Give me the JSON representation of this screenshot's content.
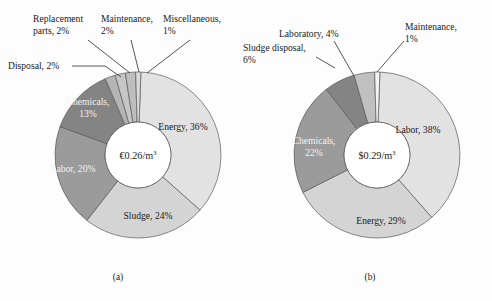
{
  "figure": {
    "background_color": "#fdfdfd",
    "subfigures": [
      {
        "caption": "(a)",
        "caption_x": 118,
        "caption_y": 280,
        "center_x": 138,
        "center_y": 155,
        "outer_radius": 83,
        "inner_radius": 33,
        "center_label_main": "€0.26/m",
        "center_label_sup": "3",
        "center_label_full": "€0.26/m³"
      },
      {
        "caption": "(b)",
        "caption_x": 370,
        "caption_y": 280,
        "center_x": 377,
        "center_y": 155,
        "outer_radius": 83,
        "inner_radius": 33,
        "center_label_main": "$0.29/m",
        "center_label_sup": "3",
        "center_label_full": "$0.29/m³"
      }
    ]
  },
  "chart_data": [
    {
      "type": "pie",
      "title": "(a)",
      "subtitle": "Operating cost breakdown, €0.26/m³",
      "center_value": "€0.26/m³",
      "unit": "percent",
      "start_angle_deg": -88,
      "direction": "clockwise",
      "grid": false,
      "legend": "none",
      "labels_placement": "inside-and-leader-lines",
      "categories": [
        "Energy",
        "Sludge",
        "Labor",
        "Chemicals",
        "Disposal",
        "Replacement parts",
        "Maintenance",
        "Miscellaneous"
      ],
      "values": [
        36,
        24,
        20,
        13,
        2,
        2,
        2,
        1
      ],
      "slices": [
        {
          "label": "Energy, 36%",
          "name": "Energy",
          "value": 36,
          "color": "#e2e2e2",
          "label_kind": "inside-dark",
          "label_x": 183,
          "label_y": 130
        },
        {
          "label": "Sludge, 24%",
          "name": "Sludge",
          "value": 24,
          "color": "#d4d4d4",
          "label_kind": "inside-dark",
          "label_x": 148,
          "label_y": 219
        },
        {
          "label": "Labor, 20%",
          "name": "Labor",
          "value": 20,
          "color": "#9b9b9b",
          "label_kind": "inside-light",
          "label_x": 73,
          "label_y": 172
        },
        {
          "label": "Chemicals,",
          "label2": "13%",
          "name": "Chemicals",
          "value": 13,
          "color": "#848484",
          "label_kind": "inside-light",
          "label_x": 88,
          "label_y": 105
        },
        {
          "label": "Disposal, 2%",
          "name": "Disposal",
          "value": 2,
          "color": "#b5b5b5",
          "label_kind": "leader",
          "label_x": 8,
          "label_y": 69,
          "leader": [
            [
              72,
              66
            ],
            [
              105,
              66
            ],
            [
              121,
              77
            ]
          ]
        },
        {
          "label": "Replacement",
          "label2": "parts, 2%",
          "name": "Replacement parts",
          "value": 2,
          "color": "#c6c6c6",
          "label_kind": "leader",
          "label_x": 33,
          "label_y": 22,
          "leader": [
            [
              88,
              40
            ],
            [
              130,
              73
            ]
          ]
        },
        {
          "label": "Maintenance,",
          "label2": "2%",
          "name": "Maintenance",
          "value": 2,
          "color": "#bdbdbd",
          "label_kind": "leader",
          "label_x": 101,
          "label_y": 22,
          "leader": [
            [
              131,
              40
            ],
            [
              139,
              72
            ]
          ]
        },
        {
          "label": "Miscellaneous,",
          "label2": "1%",
          "name": "Miscellaneous",
          "value": 1,
          "color": "#dadada",
          "label_kind": "leader",
          "label_x": 163,
          "label_y": 22,
          "leader": [
            [
              190,
              40
            ],
            [
              147,
              73
            ]
          ]
        }
      ]
    },
    {
      "type": "pie",
      "title": "(b)",
      "subtitle": "Operating cost breakdown, $0.29/m³",
      "center_value": "$0.29/m³",
      "unit": "percent",
      "start_angle_deg": -88,
      "direction": "clockwise",
      "grid": false,
      "legend": "none",
      "labels_placement": "inside-and-leader-lines",
      "categories": [
        "Labor",
        "Energy",
        "Chemicals",
        "Sludge disposal",
        "Laboratory",
        "Maintenance"
      ],
      "values": [
        38,
        29,
        22,
        6,
        4,
        1
      ],
      "slices": [
        {
          "label": "Labor, 38%",
          "name": "Labor",
          "value": 38,
          "color": "#e2e2e2",
          "label_kind": "inside-dark",
          "label_x": 418,
          "label_y": 133
        },
        {
          "label": "Energy, 29%",
          "name": "Energy",
          "value": 29,
          "color": "#d4d4d4",
          "label_kind": "inside-dark",
          "label_x": 381,
          "label_y": 224
        },
        {
          "label": "Chemicals,",
          "label2": "22%",
          "name": "Chemicals",
          "value": 22,
          "color": "#9b9b9b",
          "label_kind": "inside-light",
          "label_x": 314,
          "label_y": 144
        },
        {
          "label": "Sludge disposal,",
          "label2": "6%",
          "name": "Sludge disposal",
          "value": 6,
          "color": "#848484",
          "label_kind": "leader",
          "label_x": 243,
          "label_y": 51,
          "leader": [
            [
              316,
              57
            ],
            [
              335,
              68
            ]
          ]
        },
        {
          "label": "Laboratory, 4%",
          "name": "Laboratory",
          "value": 4,
          "color": "#c0c0c0",
          "label_kind": "leader",
          "label_x": 279,
          "label_y": 37,
          "leader": [
            [
              334,
              41
            ],
            [
              354,
              76
            ]
          ]
        },
        {
          "label": "Maintenance,",
          "label2": "1%",
          "name": "Maintenance",
          "value": 1,
          "color": "#f3f3f3",
          "label_kind": "leader",
          "label_x": 405,
          "label_y": 30,
          "leader": [
            [
              404,
              41
            ],
            [
              377,
              72
            ]
          ]
        }
      ]
    }
  ]
}
